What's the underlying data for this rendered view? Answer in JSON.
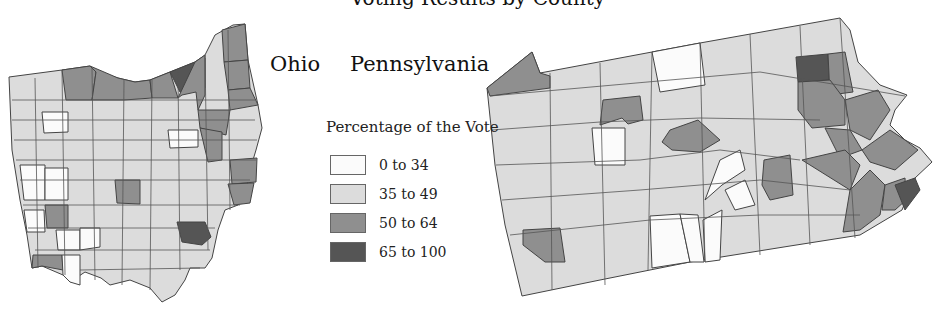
{
  "title_clipped": "Voting Results by County",
  "labels": {
    "ohio": "Ohio",
    "pennsylvania": "Pennsylvania"
  },
  "legend": {
    "title": "Percentage of the Vote",
    "items": [
      {
        "label": "0 to 34",
        "color": "#fbfbfb"
      },
      {
        "label": "35 to 49",
        "color": "#dcdcdc"
      },
      {
        "label": "50 to 64",
        "color": "#8f8f8f"
      },
      {
        "label": "65 to 100",
        "color": "#555555"
      }
    ]
  },
  "colors": {
    "border": "#444444",
    "c0": "#fbfbfb",
    "c1": "#dcdcdc",
    "c2": "#8f8f8f",
    "c3": "#555555"
  }
}
